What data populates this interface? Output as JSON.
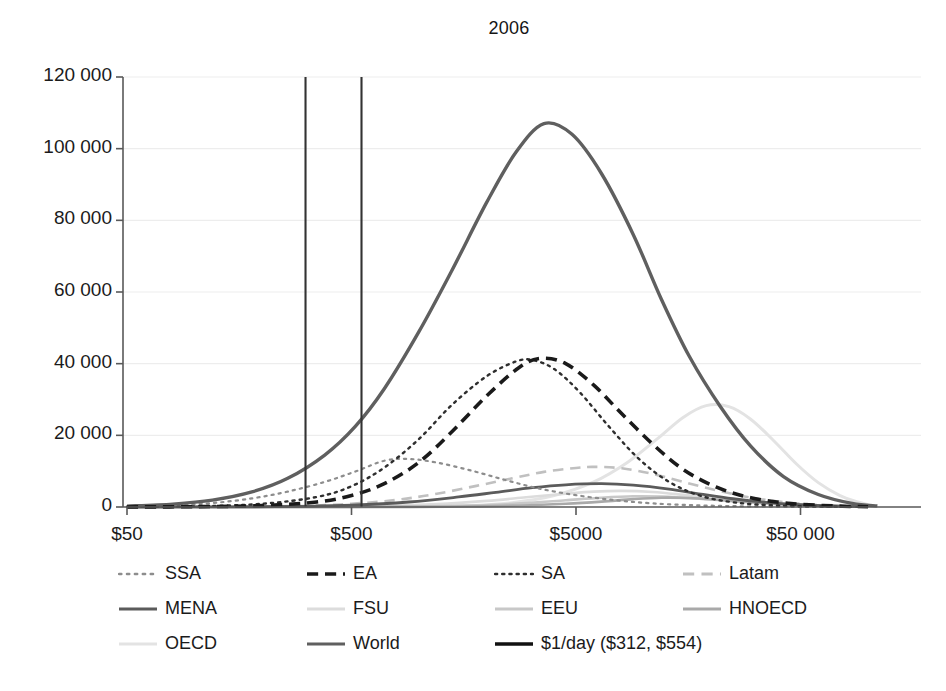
{
  "chart_data": {
    "type": "line",
    "title": "2006",
    "xlabel": "",
    "ylabel": "",
    "xscale": "log",
    "grid": true,
    "legend_position": "bottom",
    "x_ticks": [
      "$50",
      "$500",
      "$5000",
      "$50 000"
    ],
    "x_tick_values": [
      50,
      500,
      5000,
      50000
    ],
    "y_ticks": [
      "0",
      "20 000",
      "40 000",
      "60 000",
      "80 000",
      "100 000",
      "120 000"
    ],
    "y_tick_values": [
      0,
      20000,
      40000,
      60000,
      80000,
      100000,
      120000
    ],
    "ylim": [
      0,
      120000
    ],
    "xlim": [
      42,
      120000
    ],
    "annotations": [
      {
        "label": "$1/day lower bound",
        "x_value": 312
      },
      {
        "label": "$1/day upper bound",
        "x_value": 554
      }
    ],
    "series": [
      {
        "name": "SSA",
        "style": "dotted",
        "color": "#8d8d8d",
        "width": 2.2,
        "peak_x": 700,
        "peak_y": 13000,
        "points": [
          [
            50,
            150
          ],
          [
            80,
            450
          ],
          [
            120,
            1100
          ],
          [
            180,
            2400
          ],
          [
            260,
            4300
          ],
          [
            380,
            7000
          ],
          [
            520,
            9900
          ],
          [
            700,
            12900
          ],
          [
            900,
            13400
          ],
          [
            1200,
            12400
          ],
          [
            1700,
            10200
          ],
          [
            2400,
            7600
          ],
          [
            3400,
            5200
          ],
          [
            5000,
            3300
          ],
          [
            7500,
            1900
          ],
          [
            11000,
            1000
          ],
          [
            17000,
            480
          ],
          [
            26000,
            230
          ],
          [
            40000,
            100
          ],
          [
            60000,
            40
          ],
          [
            100000,
            10
          ]
        ]
      },
      {
        "name": "EA",
        "style": "dashed-bold",
        "color": "#1a1a1a",
        "width": 3.6,
        "peak_x": 3500,
        "peak_y": 41500,
        "points": [
          [
            50,
            20
          ],
          [
            100,
            90
          ],
          [
            200,
            400
          ],
          [
            350,
            1400
          ],
          [
            500,
            3200
          ],
          [
            700,
            6500
          ],
          [
            1000,
            12500
          ],
          [
            1400,
            21000
          ],
          [
            2000,
            31000
          ],
          [
            2800,
            39000
          ],
          [
            3500,
            41500
          ],
          [
            4500,
            40000
          ],
          [
            6000,
            34000
          ],
          [
            8000,
            26000
          ],
          [
            11000,
            17500
          ],
          [
            15000,
            10500
          ],
          [
            21000,
            5600
          ],
          [
            30000,
            2600
          ],
          [
            45000,
            1000
          ],
          [
            70000,
            300
          ],
          [
            100000,
            80
          ]
        ]
      },
      {
        "name": "SA",
        "style": "dotted-fine",
        "color": "#2e2e2e",
        "width": 2.4,
        "peak_x": 3200,
        "peak_y": 41000,
        "points": [
          [
            50,
            30
          ],
          [
            100,
            180
          ],
          [
            200,
            900
          ],
          [
            350,
            2800
          ],
          [
            500,
            5800
          ],
          [
            700,
            11000
          ],
          [
            1000,
            19000
          ],
          [
            1400,
            28500
          ],
          [
            2000,
            36500
          ],
          [
            2700,
            40600
          ],
          [
            3200,
            41000
          ],
          [
            4000,
            38500
          ],
          [
            5200,
            32000
          ],
          [
            7000,
            22500
          ],
          [
            9500,
            13500
          ],
          [
            13000,
            7000
          ],
          [
            18000,
            3100
          ],
          [
            26000,
            1200
          ],
          [
            40000,
            400
          ],
          [
            65000,
            100
          ],
          [
            100000,
            20
          ]
        ]
      },
      {
        "name": "Latam",
        "style": "dashed",
        "color": "#c0c0c0",
        "width": 2.6,
        "peak_x": 6000,
        "peak_y": 11200,
        "points": [
          [
            50,
            5
          ],
          [
            150,
            60
          ],
          [
            300,
            300
          ],
          [
            500,
            900
          ],
          [
            800,
            2000
          ],
          [
            1200,
            3700
          ],
          [
            1800,
            5900
          ],
          [
            2600,
            8000
          ],
          [
            3600,
            9800
          ],
          [
            5000,
            10900
          ],
          [
            6000,
            11200
          ],
          [
            8000,
            10800
          ],
          [
            11000,
            9200
          ],
          [
            15000,
            7000
          ],
          [
            21000,
            4700
          ],
          [
            29000,
            2800
          ],
          [
            40000,
            1500
          ],
          [
            56000,
            700
          ],
          [
            80000,
            250
          ],
          [
            100000,
            120
          ]
        ]
      },
      {
        "name": "MENA",
        "style": "solid",
        "color": "#5b5b5b",
        "width": 2.8,
        "peak_x": 6500,
        "peak_y": 6500,
        "points": [
          [
            50,
            2
          ],
          [
            150,
            30
          ],
          [
            300,
            180
          ],
          [
            500,
            500
          ],
          [
            900,
            1400
          ],
          [
            1500,
            2800
          ],
          [
            2200,
            4100
          ],
          [
            3200,
            5400
          ],
          [
            4500,
            6200
          ],
          [
            6500,
            6500
          ],
          [
            9000,
            6100
          ],
          [
            13000,
            5000
          ],
          [
            18000,
            3600
          ],
          [
            25000,
            2300
          ],
          [
            35000,
            1300
          ],
          [
            50000,
            650
          ],
          [
            70000,
            280
          ],
          [
            100000,
            90
          ]
        ]
      },
      {
        "name": "FSU",
        "style": "solid",
        "color": "#dcdcdc",
        "width": 2.6,
        "peak_x": 8000,
        "peak_y": 4500,
        "points": [
          [
            50,
            1
          ],
          [
            200,
            15
          ],
          [
            400,
            90
          ],
          [
            700,
            300
          ],
          [
            1200,
            800
          ],
          [
            2000,
            1700
          ],
          [
            3000,
            2700
          ],
          [
            4500,
            3700
          ],
          [
            6000,
            4300
          ],
          [
            8000,
            4500
          ],
          [
            11000,
            4200
          ],
          [
            15000,
            3400
          ],
          [
            21000,
            2400
          ],
          [
            30000,
            1400
          ],
          [
            42000,
            700
          ],
          [
            60000,
            300
          ],
          [
            100000,
            60
          ]
        ]
      },
      {
        "name": "EEU",
        "style": "solid",
        "color": "#c8c8c8",
        "width": 2.6,
        "peak_x": 9000,
        "peak_y": 3000,
        "points": [
          [
            50,
            1
          ],
          [
            300,
            10
          ],
          [
            600,
            50
          ],
          [
            1000,
            160
          ],
          [
            1800,
            450
          ],
          [
            3000,
            1100
          ],
          [
            4500,
            1900
          ],
          [
            6500,
            2600
          ],
          [
            9000,
            3000
          ],
          [
            12000,
            2900
          ],
          [
            17000,
            2400
          ],
          [
            24000,
            1700
          ],
          [
            34000,
            1000
          ],
          [
            48000,
            500
          ],
          [
            70000,
            200
          ],
          [
            100000,
            60
          ]
        ]
      },
      {
        "name": "HNOECD",
        "style": "solid",
        "color": "#a9a9a9",
        "width": 2.6,
        "peak_x": 12000,
        "peak_y": 2600,
        "points": [
          [
            50,
            0
          ],
          [
            400,
            5
          ],
          [
            900,
            35
          ],
          [
            1600,
            130
          ],
          [
            2800,
            400
          ],
          [
            4500,
            900
          ],
          [
            6500,
            1500
          ],
          [
            9000,
            2200
          ],
          [
            12000,
            2600
          ],
          [
            16000,
            2500
          ],
          [
            22000,
            2000
          ],
          [
            30000,
            1400
          ],
          [
            42000,
            800
          ],
          [
            60000,
            380
          ],
          [
            85000,
            150
          ],
          [
            100000,
            80
          ]
        ]
      },
      {
        "name": "OECD",
        "style": "solid",
        "color": "#e3e3e3",
        "width": 3.0,
        "peak_x": 19000,
        "peak_y": 28300,
        "points": [
          [
            50,
            0
          ],
          [
            400,
            10
          ],
          [
            900,
            80
          ],
          [
            1600,
            350
          ],
          [
            2600,
            1200
          ],
          [
            4000,
            3200
          ],
          [
            6000,
            7000
          ],
          [
            8500,
            12500
          ],
          [
            11500,
            19000
          ],
          [
            15000,
            25000
          ],
          [
            19000,
            28300
          ],
          [
            24000,
            28000
          ],
          [
            30000,
            24500
          ],
          [
            38000,
            18500
          ],
          [
            48000,
            12000
          ],
          [
            60000,
            6800
          ],
          [
            75000,
            3200
          ],
          [
            90000,
            1400
          ],
          [
            100000,
            700
          ]
        ]
      },
      {
        "name": "World",
        "style": "solid",
        "color": "#5f5f5f",
        "width": 3.4,
        "peak_x": 3600,
        "peak_y": 107000,
        "points": [
          [
            50,
            250
          ],
          [
            80,
            800
          ],
          [
            120,
            1900
          ],
          [
            180,
            4200
          ],
          [
            260,
            8000
          ],
          [
            380,
            14500
          ],
          [
            520,
            22500
          ],
          [
            700,
            33000
          ],
          [
            1000,
            49000
          ],
          [
            1400,
            66000
          ],
          [
            2000,
            85000
          ],
          [
            2700,
            99000
          ],
          [
            3600,
            107000
          ],
          [
            4800,
            104000
          ],
          [
            6500,
            93000
          ],
          [
            9000,
            76000
          ],
          [
            12000,
            58000
          ],
          [
            16000,
            42000
          ],
          [
            22000,
            28000
          ],
          [
            30000,
            17000
          ],
          [
            42000,
            8500
          ],
          [
            60000,
            3500
          ],
          [
            85000,
            1000
          ],
          [
            110000,
            300
          ]
        ]
      }
    ]
  },
  "legend": {
    "rows": [
      [
        {
          "label": "SSA",
          "style": "dotted",
          "color": "#8d8d8d"
        },
        {
          "label": "EA",
          "style": "dashed-bold",
          "color": "#1a1a1a"
        },
        {
          "label": "SA",
          "style": "dotted-fine",
          "color": "#2e2e2e"
        },
        {
          "label": "Latam",
          "style": "dashed",
          "color": "#c0c0c0"
        }
      ],
      [
        {
          "label": "MENA",
          "style": "solid",
          "color": "#5b5b5b"
        },
        {
          "label": "FSU",
          "style": "solid",
          "color": "#dcdcdc"
        },
        {
          "label": "EEU",
          "style": "solid",
          "color": "#c8c8c8"
        },
        {
          "label": "HNOECD",
          "style": "solid",
          "color": "#a9a9a9"
        }
      ],
      [
        {
          "label": "OECD",
          "style": "solid",
          "color": "#e3e3e3"
        },
        {
          "label": "World",
          "style": "solid",
          "color": "#5f5f5f"
        },
        {
          "label": "$1/day ($312, $554)",
          "style": "solid-bold",
          "color": "#111111"
        }
      ]
    ]
  },
  "colors": {
    "axis": "#595959",
    "grid": "#ededed",
    "text": "#1b1b1b",
    "background": "#ffffff"
  }
}
